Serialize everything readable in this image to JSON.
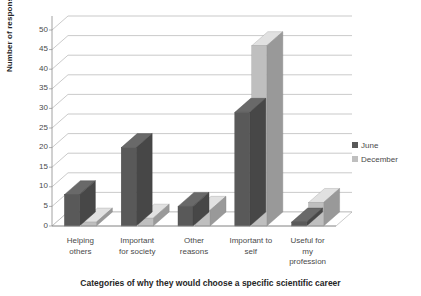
{
  "chart_data": {
    "type": "bar",
    "title": "",
    "subtitle": "",
    "xlabel": "Categories of why they would choose a specific scientific career",
    "ylabel": "Number of responses",
    "ylim": [
      0,
      50
    ],
    "ytick_step": 5,
    "yticks": [
      "0",
      "5",
      "10",
      "15",
      "20",
      "25",
      "30",
      "35",
      "40",
      "45",
      "50"
    ],
    "grid": true,
    "legend_position": "right",
    "style": "3d-clustered-column",
    "categories": [
      "Helping others",
      "Important for society",
      "Other reasons",
      "Important to self",
      "Useful for my profession"
    ],
    "category_lines": [
      [
        "Helping",
        "others"
      ],
      [
        "Important",
        "for society"
      ],
      [
        "Other",
        "reasons"
      ],
      [
        "Important to",
        "self"
      ],
      [
        "Useful for",
        "my",
        "profession"
      ]
    ],
    "series": [
      {
        "name": "June",
        "color": "#595959",
        "values": [
          8,
          20,
          5,
          29,
          1
        ]
      },
      {
        "name": "December",
        "color": "#bfbfbf",
        "values": [
          1,
          2,
          4,
          46,
          6
        ]
      }
    ]
  },
  "legend": {
    "items": [
      {
        "label": "June",
        "color": "#595959"
      },
      {
        "label": "December",
        "color": "#bfbfbf"
      }
    ]
  },
  "colors": {
    "june": "#595959",
    "december": "#bfbfbf",
    "gridline": "#a6a6a6",
    "axis": "#8c8c8c",
    "text": "#4a4a4a",
    "title_text": "#262626",
    "floor": "#ffffff"
  }
}
